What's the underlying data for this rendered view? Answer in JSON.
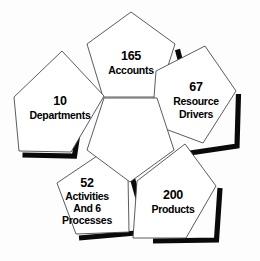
{
  "diagram": {
    "type": "pentagon-rosette",
    "title": "",
    "header_remnant": "",
    "background_color": "#fdfdfd",
    "outline_color": "#4a4a4a",
    "shadow_color": "#0a0a0a",
    "face_color": "#ffffff",
    "text_color": "#000000",
    "center": {
      "label": "",
      "orientation": "point-down"
    },
    "petals": [
      {
        "id": "accounts",
        "position": "top",
        "count": "165",
        "lines": [
          "Accounts"
        ],
        "text_x": 130,
        "text_y": 62,
        "angle": -90
      },
      {
        "id": "resource-drivers",
        "position": "right",
        "count": "67",
        "lines": [
          "Resource",
          "Drivers"
        ],
        "text_x": 198,
        "text_y": 104,
        "angle": -18
      },
      {
        "id": "products",
        "position": "bottom-right",
        "count": "200",
        "lines": [
          "Products"
        ],
        "text_x": 172,
        "text_y": 198,
        "angle": 54
      },
      {
        "id": "activities-processes",
        "position": "bottom-left",
        "count": "52",
        "lines": [
          "Activities",
          "And 6",
          "Processes"
        ],
        "text_x": 86,
        "text_y": 185,
        "angle": 126
      },
      {
        "id": "departments",
        "position": "left",
        "count": "10",
        "lines": [
          "Departments"
        ],
        "text_x": 62,
        "text_y": 106,
        "angle": 198
      }
    ]
  }
}
